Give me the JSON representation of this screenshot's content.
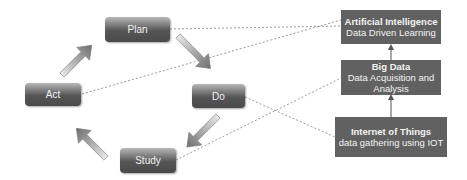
{
  "cycle": {
    "plan": "Plan",
    "do": "Do",
    "study": "Study",
    "act": "Act"
  },
  "technologies": {
    "ai": {
      "title": "Artificial Intelligence",
      "subtitle": "Data Driven Learning"
    },
    "big_data": {
      "title": "Big Data",
      "subtitle_line1": "Data Acquisition and",
      "subtitle_line2": "Analysis"
    },
    "iot": {
      "title": "Internet of Things",
      "subtitle": "data gathering using IOT"
    }
  },
  "colors": {
    "tech_box": "#616161",
    "dashed_line": "#9a9a9a",
    "arrow_dark": "#6e6e6e",
    "arrow_light": "#e8e8e8"
  }
}
